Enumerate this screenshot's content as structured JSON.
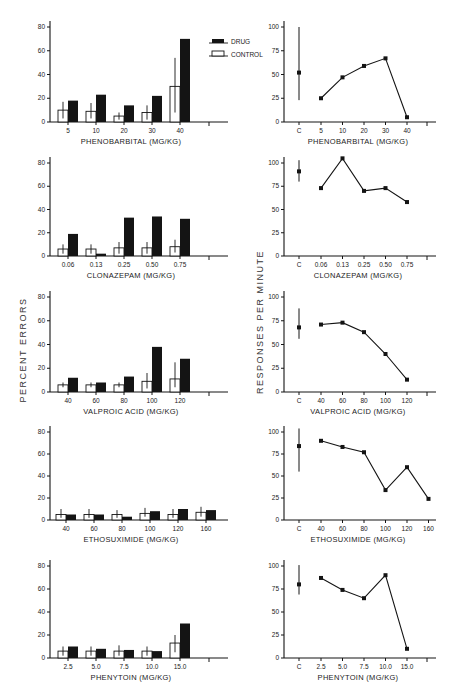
{
  "figure": {
    "left_ylabel": "PERCENT  ERRORS",
    "right_ylabel": "RESPONSES  PER  MINUTE",
    "legend": {
      "drug": "DRUG",
      "control": "CONTROL"
    }
  },
  "chart_data": [
    {
      "type": "bar",
      "panel": "left-1",
      "title": "",
      "xlabel": "PHENOBARBITAL (MG/KG)",
      "ylabel": "PERCENT ERRORS",
      "ylim": [
        0,
        80
      ],
      "yticks": [
        0,
        20,
        40,
        60,
        80
      ],
      "categories": [
        "5",
        "10",
        "20",
        "30",
        "40"
      ],
      "series": [
        {
          "name": "CONTROL",
          "values": [
            10,
            9,
            5,
            8,
            30
          ],
          "err_low": [
            3,
            3,
            2,
            2,
            8
          ],
          "err_high": [
            17,
            16,
            8,
            14,
            54
          ]
        },
        {
          "name": "DRUG",
          "values": [
            18,
            23,
            14,
            22,
            70
          ]
        }
      ],
      "legend_position": "upper-right"
    },
    {
      "type": "line",
      "panel": "right-1",
      "xlabel": "PHENOBARBITAL (MG/KG)",
      "ylabel": "RESPONSES PER MINUTE",
      "ylim": [
        0,
        100
      ],
      "yticks": [
        0,
        25,
        50,
        75,
        100
      ],
      "control": {
        "label": "C",
        "value": 52,
        "err_low": 23,
        "err_high": 100
      },
      "categories": [
        "5",
        "10",
        "20",
        "30",
        "40"
      ],
      "values": [
        25,
        47,
        59,
        67,
        5
      ]
    },
    {
      "type": "bar",
      "panel": "left-2",
      "xlabel": "CLONAZEPAM (MG/KG)",
      "ylabel": "PERCENT ERRORS",
      "ylim": [
        0,
        80
      ],
      "yticks": [
        0,
        20,
        40,
        60,
        80
      ],
      "categories": [
        "0.06",
        "0.13",
        "0.25",
        "0.50",
        "0.75"
      ],
      "series": [
        {
          "name": "CONTROL",
          "values": [
            6,
            6,
            7,
            7,
            8
          ],
          "err_low": [
            2,
            2,
            2,
            2,
            3
          ],
          "err_high": [
            10,
            10,
            12,
            12,
            14
          ]
        },
        {
          "name": "DRUG",
          "values": [
            19,
            2,
            33,
            34,
            32
          ]
        }
      ]
    },
    {
      "type": "line",
      "panel": "right-2",
      "xlabel": "CLONAZEPAM (MG/KG)",
      "ylabel": "RESPONSES PER MINUTE",
      "ylim": [
        0,
        100
      ],
      "yticks": [
        0,
        25,
        50,
        75,
        100
      ],
      "control": {
        "label": "C",
        "value": 91,
        "err_low": 80,
        "err_high": 103
      },
      "categories": [
        "0.06",
        "0.13",
        "0.25",
        "0.50",
        "0.75"
      ],
      "values": [
        73,
        105,
        70,
        73,
        58
      ]
    },
    {
      "type": "bar",
      "panel": "left-3",
      "xlabel": "VALPROIC ACID (MG/KG)",
      "ylabel": "PERCENT ERRORS",
      "ylim": [
        0,
        80
      ],
      "yticks": [
        0,
        20,
        40,
        60,
        80
      ],
      "categories": [
        "40",
        "60",
        "80",
        "100",
        "120"
      ],
      "series": [
        {
          "name": "CONTROL",
          "values": [
            6,
            6,
            6,
            9,
            11
          ],
          "err_low": [
            4,
            4,
            4,
            3,
            4
          ],
          "err_high": [
            8,
            8,
            8,
            16,
            25
          ]
        },
        {
          "name": "DRUG",
          "values": [
            12,
            8,
            13,
            38,
            28
          ]
        }
      ]
    },
    {
      "type": "line",
      "panel": "right-3",
      "xlabel": "VALPROIC ACID (MG/KG)",
      "ylabel": "RESPONSES PER MINUTE",
      "ylim": [
        0,
        100
      ],
      "yticks": [
        0,
        25,
        50,
        75,
        100
      ],
      "control": {
        "label": "C",
        "value": 68,
        "err_low": 56,
        "err_high": 88
      },
      "categories": [
        "40",
        "60",
        "80",
        "100",
        "120"
      ],
      "values": [
        71,
        73,
        63,
        40,
        13
      ]
    },
    {
      "type": "bar",
      "panel": "left-4",
      "xlabel": "ETHOSUXIMIDE (MG/KG)",
      "ylabel": "PERCENT ERRORS",
      "ylim": [
        0,
        80
      ],
      "yticks": [
        0,
        20,
        40,
        60,
        80
      ],
      "categories": [
        "40",
        "60",
        "80",
        "100",
        "120",
        "160"
      ],
      "series": [
        {
          "name": "CONTROL",
          "values": [
            5,
            5,
            5,
            6,
            5,
            7
          ],
          "err_low": [
            2,
            2,
            2,
            3,
            2,
            3
          ],
          "err_high": [
            10,
            10,
            9,
            11,
            10,
            12
          ]
        },
        {
          "name": "DRUG",
          "values": [
            5,
            5,
            3,
            8,
            10,
            9
          ]
        }
      ]
    },
    {
      "type": "line",
      "panel": "right-4",
      "xlabel": "ETHOSUXIMIDE (MG/KG)",
      "ylabel": "RESPONSES PER MINUTE",
      "ylim": [
        0,
        100
      ],
      "yticks": [
        0,
        25,
        50,
        75,
        100
      ],
      "control": {
        "label": "C",
        "value": 84,
        "err_low": 55,
        "err_high": 105
      },
      "categories": [
        "40",
        "60",
        "80",
        "100",
        "120",
        "160"
      ],
      "values": [
        90,
        83,
        77,
        34,
        60,
        24
      ]
    },
    {
      "type": "bar",
      "panel": "left-5",
      "xlabel": "PHENYTOIN (MG/KG)",
      "ylabel": "PERCENT ERRORS",
      "ylim": [
        0,
        80
      ],
      "yticks": [
        0,
        20,
        40,
        60,
        80
      ],
      "categories": [
        "2.5",
        "5.0",
        "7.5",
        "10.0",
        "15.0"
      ],
      "series": [
        {
          "name": "CONTROL",
          "values": [
            6,
            6,
            6,
            6,
            13
          ],
          "err_low": [
            2,
            2,
            2,
            2,
            5
          ],
          "err_high": [
            10,
            10,
            11,
            10,
            20
          ]
        },
        {
          "name": "DRUG",
          "values": [
            10,
            8,
            7,
            6,
            30
          ]
        }
      ]
    },
    {
      "type": "line",
      "panel": "right-5",
      "xlabel": "PHENYTOIN (MG/KG)",
      "ylabel": "RESPONSES PER MINUTE",
      "ylim": [
        0,
        100
      ],
      "yticks": [
        0,
        25,
        50,
        75,
        100
      ],
      "control": {
        "label": "C",
        "value": 80,
        "err_low": 69,
        "err_high": 101
      },
      "categories": [
        "2.5",
        "5.0",
        "7.5",
        "10.0",
        "15.0"
      ],
      "values": [
        87,
        74,
        65,
        90,
        10
      ]
    }
  ]
}
